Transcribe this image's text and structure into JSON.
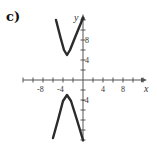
{
  "panel_label": "c)",
  "chart_data": {
    "type": "line",
    "title": "",
    "xlabel": "x",
    "ylabel": "y",
    "x_ticks": [
      "-8",
      "-4",
      "4",
      "8"
    ],
    "y_ticks": [
      "4",
      "8",
      "-4"
    ],
    "xlim": [
      -12,
      12
    ],
    "ylim": [
      -12,
      14
    ],
    "grid": false,
    "series": [
      {
        "name": "upper branch",
        "points": [
          [
            -5.4,
            12
          ],
          [
            -4.5,
            8.5
          ],
          [
            -3.8,
            6
          ],
          [
            -3.2,
            5
          ],
          [
            -2.6,
            6
          ],
          [
            -1.6,
            8.5
          ],
          [
            0,
            12.4
          ]
        ]
      },
      {
        "name": "lower branch",
        "points": [
          [
            -6,
            -11.6
          ],
          [
            -5,
            -8
          ],
          [
            -4,
            -4.2
          ],
          [
            -3.2,
            -3
          ],
          [
            -2.4,
            -4.2
          ],
          [
            -1.2,
            -8
          ],
          [
            0,
            -12
          ]
        ]
      }
    ],
    "color": "#2b2b2b"
  }
}
